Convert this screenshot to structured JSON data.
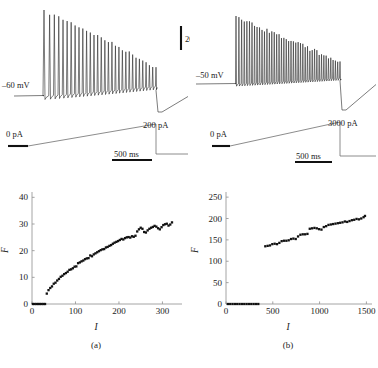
{
  "figure": {
    "panels": [
      {
        "id": "a",
        "caption": "(a)",
        "trace": {
          "voltage_label": "–60 mV",
          "scalebar_voltage": "20 mV",
          "current_start_label": "0 pA",
          "current_end_label": "200 pA",
          "scalebar_time": "500 ms"
        }
      },
      {
        "id": "b",
        "caption": "(b)",
        "trace": {
          "voltage_label": "–50 mV",
          "scalebar_voltage": "",
          "current_start_label": "0 pA",
          "current_end_label": "3000 pA",
          "scalebar_time": "500 ms"
        }
      }
    ]
  },
  "chart_data": [
    {
      "type": "scatter",
      "panel": "a",
      "title": "",
      "xlabel": "I",
      "ylabel": "F",
      "xlim": [
        0,
        345
      ],
      "ylim": [
        0,
        42
      ],
      "xticks": [
        0,
        100,
        200,
        300
      ],
      "yticks": [
        0,
        10,
        20,
        30,
        40
      ],
      "grid": false,
      "legend": "none",
      "x": [
        2,
        6,
        10,
        14,
        18,
        22,
        26,
        30,
        34,
        38,
        42,
        46,
        50,
        54,
        58,
        62,
        66,
        70,
        74,
        78,
        82,
        86,
        90,
        94,
        98,
        102,
        106,
        110,
        114,
        118,
        122,
        126,
        130,
        134,
        138,
        142,
        146,
        150,
        154,
        158,
        162,
        166,
        170,
        174,
        178,
        182,
        186,
        190,
        194,
        198,
        202,
        206,
        210,
        214,
        218,
        222,
        226,
        230,
        234,
        238,
        242,
        246,
        250,
        254,
        258,
        262,
        266,
        270,
        274,
        278,
        282,
        286,
        290,
        294,
        298,
        302,
        306,
        310,
        314,
        318,
        322
      ],
      "y": [
        0,
        0,
        0,
        0,
        0,
        0,
        0,
        0,
        3.9,
        5.2,
        6.0,
        6.6,
        7.6,
        8.0,
        8.8,
        9.4,
        10.2,
        10.6,
        11.2,
        11.6,
        12.1,
        12.8,
        13.0,
        13.4,
        14.0,
        14.1,
        15.3,
        15.6,
        16.0,
        16.3,
        16.8,
        17.1,
        17.2,
        18.2,
        17.9,
        18.6,
        19.0,
        19.4,
        19.8,
        20.2,
        20.5,
        20.6,
        21.2,
        21.4,
        21.8,
        22.1,
        22.6,
        23.0,
        23.3,
        23.6,
        24.0,
        24.4,
        24.2,
        24.7,
        25.0,
        25.1,
        24.9,
        25.4,
        25.2,
        25.6,
        27.2,
        28.0,
        28.6,
        28.2,
        27.0,
        26.8,
        27.6,
        28.2,
        28.6,
        28.9,
        29.3,
        29.0,
        28.4,
        28.0,
        28.8,
        29.6,
        29.9,
        30.1,
        29.4,
        29.8,
        30.6
      ]
    },
    {
      "type": "scatter",
      "panel": "b",
      "title": "",
      "xlabel": "I",
      "ylabel": "F",
      "xlim": [
        0,
        1560
      ],
      "ylim": [
        0,
        262
      ],
      "xticks": [
        0,
        500,
        1000,
        1500
      ],
      "yticks": [
        0,
        50,
        100,
        150,
        200,
        250
      ],
      "grid": false,
      "legend": "none",
      "x": [
        20,
        45,
        70,
        95,
        120,
        145,
        170,
        195,
        220,
        245,
        270,
        295,
        320,
        345,
        420,
        445,
        470,
        495,
        520,
        545,
        570,
        595,
        620,
        645,
        670,
        695,
        720,
        745,
        770,
        795,
        820,
        845,
        870,
        895,
        920,
        945,
        970,
        995,
        1020,
        1045,
        1070,
        1095,
        1120,
        1145,
        1170,
        1195,
        1220,
        1245,
        1270,
        1295,
        1320,
        1345,
        1370,
        1395,
        1420,
        1445,
        1470,
        1485
      ],
      "y": [
        0,
        0,
        0,
        0,
        0,
        0,
        0,
        0,
        0,
        0,
        0,
        0,
        0,
        0,
        135,
        136,
        137,
        140,
        141,
        140,
        143,
        147,
        148,
        148,
        149,
        152,
        153,
        152,
        158,
        162,
        163,
        163,
        164,
        176,
        177,
        178,
        177,
        175,
        174,
        180,
        182,
        185,
        186,
        187,
        188,
        189,
        190,
        191,
        193,
        192,
        194,
        196,
        197,
        199,
        198,
        200,
        203,
        206
      ]
    }
  ]
}
